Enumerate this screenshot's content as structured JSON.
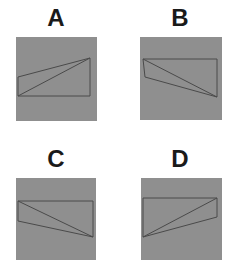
{
  "figure": {
    "background": "#ffffff",
    "square_fill": "#8f8f8f",
    "line_color": "#4a4a4a",
    "panels": [
      {
        "label": "A",
        "label_pos": [
          36,
          6
        ],
        "square": {
          "x": 16,
          "y": 37,
          "w": 81,
          "h": 84
        },
        "outline": [
          [
            18,
            77
          ],
          [
            90,
            58
          ],
          [
            90,
            96
          ],
          [
            18,
            96
          ]
        ],
        "diagonal": [
          [
            18,
            96
          ],
          [
            90,
            58
          ]
        ]
      },
      {
        "label": "B",
        "label_pos": [
          160,
          6
        ],
        "square": {
          "x": 140,
          "y": 37,
          "w": 82,
          "h": 83
        },
        "outline": [
          [
            143,
            59
          ],
          [
            217,
            59
          ],
          [
            217,
            97
          ],
          [
            145,
            77
          ]
        ],
        "diagonal": [
          [
            143,
            59
          ],
          [
            217,
            97
          ]
        ]
      },
      {
        "label": "C",
        "label_pos": [
          36,
          147
        ],
        "square": {
          "x": 16,
          "y": 178,
          "w": 80,
          "h": 82
        },
        "outline": [
          [
            18,
            201
          ],
          [
            93,
            201
          ],
          [
            93,
            237
          ],
          [
            18,
            221
          ]
        ],
        "diagonal": [
          [
            18,
            201
          ],
          [
            93,
            237
          ]
        ]
      },
      {
        "label": "D",
        "label_pos": [
          160,
          147
        ],
        "square": {
          "x": 141,
          "y": 178,
          "w": 81,
          "h": 82
        },
        "outline": [
          [
            143,
            198
          ],
          [
            217,
            198
          ],
          [
            217,
            217
          ],
          [
            143,
            237
          ]
        ],
        "diagonal": [
          [
            143,
            237
          ],
          [
            217,
            198
          ]
        ]
      }
    ]
  }
}
